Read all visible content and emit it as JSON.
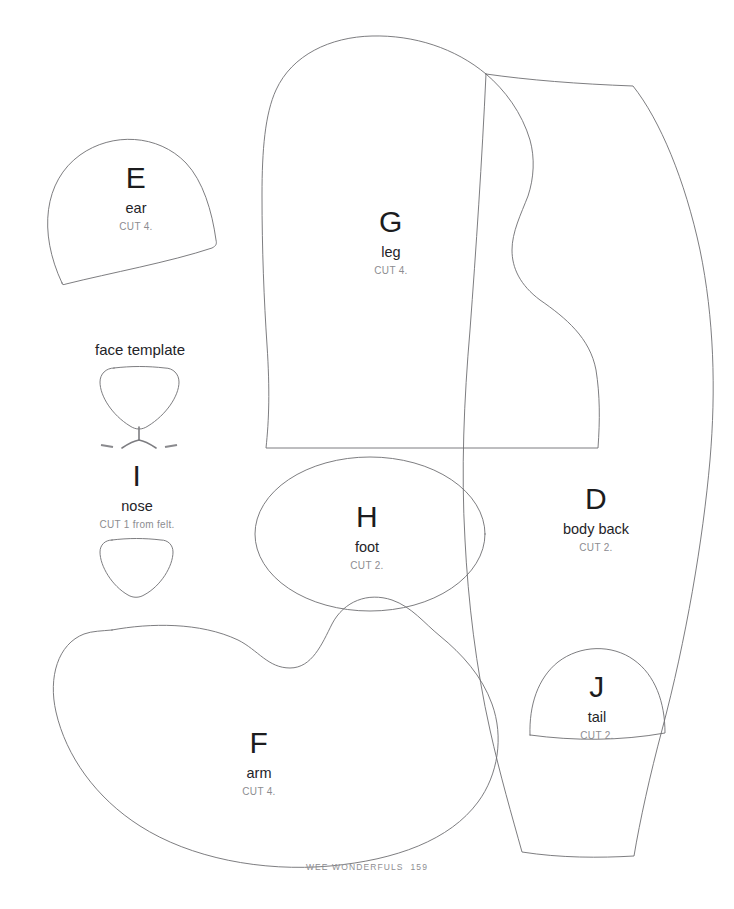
{
  "page": {
    "background_color": "#ffffff",
    "outline_color": "#6e6e72",
    "heading_color": "#242428",
    "cut_color": "#8c8c90",
    "width": 734,
    "height": 909
  },
  "headings": {
    "face_template": "face template"
  },
  "pieces": [
    {
      "id": "ear",
      "letter": "E",
      "name": "ear",
      "cut": "CUT 4."
    },
    {
      "id": "leg",
      "letter": "G",
      "name": "leg",
      "cut": "CUT 4."
    },
    {
      "id": "body-back",
      "letter": "D",
      "name": "body back",
      "cut": "CUT 2."
    },
    {
      "id": "nose",
      "letter": "I",
      "name": "nose",
      "cut": "CUT 1 from felt."
    },
    {
      "id": "foot",
      "letter": "H",
      "name": "foot",
      "cut": "CUT 2."
    },
    {
      "id": "arm",
      "letter": "F",
      "name": "arm",
      "cut": "CUT 4."
    },
    {
      "id": "tail",
      "letter": "J",
      "name": "tail",
      "cut": "CUT 2."
    }
  ],
  "footer": {
    "book_title": "WEE WONDERFULS",
    "page_number": "159"
  }
}
